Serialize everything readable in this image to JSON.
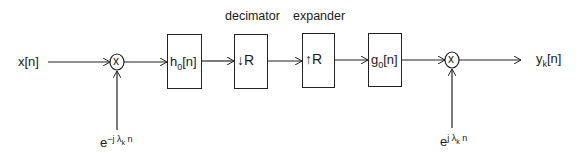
{
  "diagram": {
    "input": {
      "label": "x",
      "arg": "[n]"
    },
    "output": {
      "label": "y",
      "sub": "k",
      "arg": "[n]"
    },
    "blocks": [
      {
        "id": "analysis-filter",
        "main": "h",
        "sub": "0",
        "arg": "[n]"
      },
      {
        "id": "decimator",
        "top_label": "decimator",
        "arrow": "↓",
        "main": "R"
      },
      {
        "id": "expander",
        "top_label": "expander",
        "arrow": "↑",
        "main": "R"
      },
      {
        "id": "synthesis-filter",
        "main": "g",
        "sub": "0",
        "arg": "[n]"
      }
    ],
    "multipliers": [
      {
        "id": "demodulator",
        "symbol": "x",
        "input_label": {
          "base": "e",
          "exp_pre": "−j λ",
          "exp_sub": "k",
          "exp_post": " n"
        }
      },
      {
        "id": "modulator",
        "symbol": "x",
        "input_label": {
          "base": "e",
          "exp_pre": "j λ",
          "exp_sub": "k",
          "exp_post": " n"
        }
      }
    ],
    "line_color": "#222222"
  }
}
